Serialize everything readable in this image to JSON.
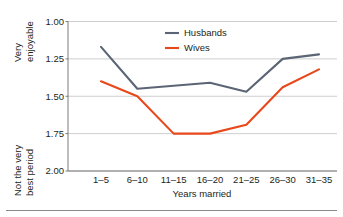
{
  "chart_data": {
    "type": "line",
    "title": "",
    "xlabel": "Years married",
    "ylabel": "",
    "categories": [
      "1–5",
      "6–10",
      "11–15",
      "16–20",
      "21–25",
      "26–30",
      "31–35"
    ],
    "series": [
      {
        "name": "Husbands",
        "color": "#5c6575",
        "values": [
          1.17,
          1.45,
          1.43,
          1.41,
          1.47,
          1.25,
          1.22
        ]
      },
      {
        "name": "Wives",
        "color": "#e8481c",
        "values": [
          1.4,
          1.5,
          1.75,
          1.75,
          1.69,
          1.44,
          1.32
        ]
      }
    ],
    "yticks": [
      "1.00",
      "1.25",
      "1.50",
      "1.75",
      "2.00"
    ],
    "ytick_values": [
      1.0,
      1.25,
      1.5,
      1.75,
      2.0
    ],
    "ylim": [
      1.0,
      2.0
    ],
    "y_inverted": true,
    "grid": true,
    "legend_position": "top-center",
    "y_top_label": "Very enjoyable",
    "y_bottom_label": "Not the very best period"
  },
  "axis": {
    "y_top_caption": "Very enjoyable",
    "y_bottom_caption": "Not the very best period",
    "x_title": "Years married"
  },
  "legend": {
    "items": [
      {
        "label": "Husbands",
        "color": "#5c6575"
      },
      {
        "label": "Wives",
        "color": "#e8481c"
      }
    ]
  },
  "colors": {
    "husbands": "#5c6575",
    "wives": "#e8481c",
    "grid": "#b9b9b9",
    "axis": "#6d6d6d",
    "text": "#231f20",
    "background": "#ffffff"
  }
}
